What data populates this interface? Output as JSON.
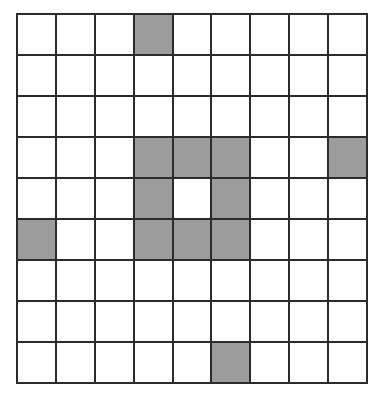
{
  "figure": {
    "type": "shaded-grid",
    "rows": 9,
    "columns": 9,
    "cell_fill_empty_color": "#ffffff",
    "cell_fill_shaded_color": "#9c9c9c",
    "gridline_color": "#2b2b2b",
    "gridline_width_px": 2,
    "background_color": "#ffffff",
    "canvas_width_px": 383,
    "canvas_height_px": 398
  },
  "chart_data": {
    "type": "heatmap",
    "title": "",
    "subtitle": "",
    "xlabel": "",
    "ylabel": "",
    "legend": [],
    "annotations": [],
    "grid": true,
    "rows": 9,
    "columns": 9,
    "row_labels": [
      "1",
      "2",
      "3",
      "4",
      "5",
      "6",
      "7",
      "8",
      "9"
    ],
    "column_labels": [
      "1",
      "2",
      "3",
      "4",
      "5",
      "6",
      "7",
      "8",
      "9"
    ],
    "values": [
      [
        0,
        0,
        0,
        1,
        0,
        0,
        0,
        0,
        0
      ],
      [
        0,
        0,
        0,
        0,
        0,
        0,
        0,
        0,
        0
      ],
      [
        0,
        0,
        0,
        0,
        0,
        0,
        0,
        0,
        0
      ],
      [
        0,
        0,
        0,
        1,
        1,
        1,
        0,
        0,
        1
      ],
      [
        0,
        0,
        0,
        1,
        0,
        1,
        0,
        0,
        0
      ],
      [
        1,
        0,
        0,
        1,
        1,
        1,
        0,
        0,
        0
      ],
      [
        0,
        0,
        0,
        0,
        0,
        0,
        0,
        0,
        0
      ],
      [
        0,
        0,
        0,
        0,
        0,
        0,
        0,
        0,
        0
      ],
      [
        0,
        0,
        0,
        0,
        0,
        1,
        0,
        0,
        0
      ]
    ],
    "shaded_cells": [
      {
        "row": 1,
        "column": 4
      },
      {
        "row": 4,
        "column": 4
      },
      {
        "row": 4,
        "column": 5
      },
      {
        "row": 4,
        "column": 6
      },
      {
        "row": 4,
        "column": 9
      },
      {
        "row": 5,
        "column": 4
      },
      {
        "row": 5,
        "column": 6
      },
      {
        "row": 6,
        "column": 1
      },
      {
        "row": 6,
        "column": 4
      },
      {
        "row": 6,
        "column": 5
      },
      {
        "row": 6,
        "column": 6
      },
      {
        "row": 9,
        "column": 6
      }
    ],
    "shaded_count": 12,
    "total_cells": 81,
    "colorscale": {
      "0": "#ffffff",
      "1": "#9c9c9c"
    }
  }
}
